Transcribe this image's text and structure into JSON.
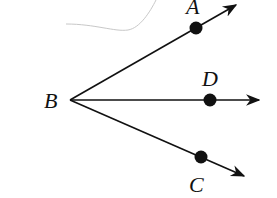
{
  "diagram": {
    "type": "rays from common vertex",
    "vertex": {
      "label": "B",
      "x": 70,
      "y": 100
    },
    "rays": [
      {
        "name": "ray-BA",
        "point": {
          "label": "A",
          "x": 196,
          "y": 28
        },
        "tip": {
          "x": 236,
          "y": 5
        },
        "label_pos": {
          "x": 186,
          "y": 14
        }
      },
      {
        "name": "ray-BD",
        "point": {
          "label": "D",
          "x": 210,
          "y": 100
        },
        "tip": {
          "x": 259,
          "y": 100
        },
        "label_pos": {
          "x": 202,
          "y": 86
        }
      },
      {
        "name": "ray-BC",
        "point": {
          "label": "C",
          "x": 201,
          "y": 157
        },
        "tip": {
          "x": 244,
          "y": 176
        },
        "label_pos": {
          "x": 189,
          "y": 192
        }
      }
    ],
    "vertex_label_pos": {
      "x": 44,
      "y": 108
    },
    "colors": {
      "stroke": "#111111",
      "smudge": "#c8c8c8"
    }
  }
}
